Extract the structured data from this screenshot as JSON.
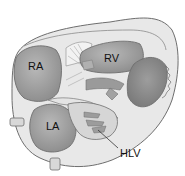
{
  "diagram": {
    "labels": {
      "ra": "RA",
      "rv": "RV",
      "la": "LA",
      "hlv": "HLV"
    },
    "colors": {
      "background": "#ffffff",
      "outline": "#6e6e6e",
      "wall_fill": "#e6e6e6",
      "chamber_fill": "#a9a9a9",
      "chamber_dark": "#8f8f8f",
      "tissue_light": "#d4d4d4",
      "text": "#111111"
    }
  }
}
